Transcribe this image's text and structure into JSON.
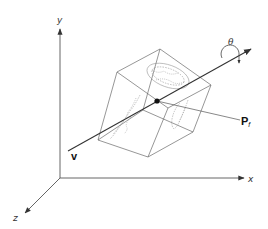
{
  "figure": {
    "colors": {
      "background": "#ffffff",
      "axis": "#555555",
      "cube_edges": "#666666",
      "vector": "#333333",
      "point": "#111111",
      "texture": "#888888"
    }
  },
  "axes": {
    "x_label": "x",
    "y_label": "y",
    "z_label": "z"
  },
  "labels": {
    "vector_v": "v",
    "point_main": "P",
    "point_sub": "f",
    "angle": "θ"
  },
  "icons": {
    "rotation": "rotation-arrow-icon",
    "arrowheads": "arrowhead-icon"
  }
}
